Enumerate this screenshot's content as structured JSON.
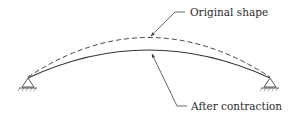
{
  "diagram": {
    "type": "arched-beam-deformation",
    "labels": {
      "original": "Original shape",
      "after": "After contraction"
    },
    "curves": {
      "original": {
        "style": "dashed",
        "description": "original arch shape (higher)"
      },
      "after": {
        "style": "solid",
        "description": "arch shape after contraction (lower)"
      }
    },
    "supports": [
      {
        "side": "left",
        "type": "pin"
      },
      {
        "side": "right",
        "type": "pin"
      }
    ],
    "colors": {
      "line": "#3a3a3a",
      "text": "#2a2a2a",
      "background": "#ffffff"
    }
  }
}
